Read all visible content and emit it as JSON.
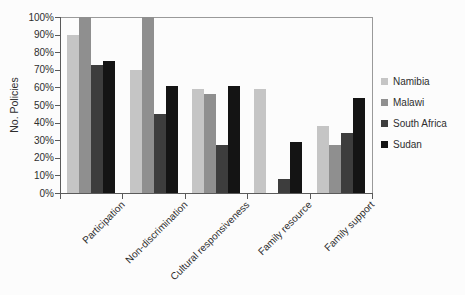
{
  "chart_data": {
    "type": "bar",
    "title": "",
    "ylabel": "No. Policies",
    "xlabel": "",
    "categories": [
      "Participation",
      "Non-discrimination",
      "Cultural responsiveness",
      "Family resource",
      "Family support"
    ],
    "series": [
      {
        "name": "Namibia",
        "color": "#c5c5c5",
        "values": [
          90,
          70,
          59,
          59,
          38
        ]
      },
      {
        "name": "Malawi",
        "color": "#8f8f8f",
        "values": [
          100,
          100,
          56,
          0,
          27
        ]
      },
      {
        "name": "South Africa",
        "color": "#3d3d3d",
        "values": [
          73,
          45,
          27,
          8,
          34
        ]
      },
      {
        "name": "Sudan",
        "color": "#141414",
        "values": [
          75,
          61,
          61,
          29,
          54
        ]
      }
    ],
    "ylim": [
      0,
      100
    ],
    "ytick_labels": [
      "0%",
      "10%",
      "20%",
      "30%",
      "40%",
      "50%",
      "60%",
      "70%",
      "80%",
      "90%",
      "100%"
    ],
    "legend_position": "right",
    "grid": false
  }
}
